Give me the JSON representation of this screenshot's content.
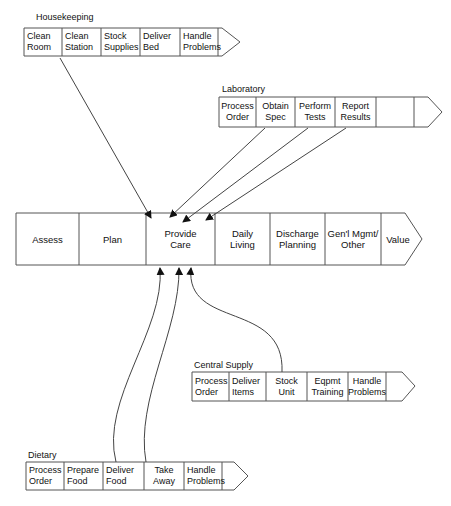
{
  "diagram": {
    "main_chain": {
      "cells": [
        {
          "label": "Assess"
        },
        {
          "label": "Plan"
        },
        {
          "label": "Provide\nCare"
        },
        {
          "label": "Daily\nLiving"
        },
        {
          "label": "Discharge\nPlanning"
        },
        {
          "label": "Gen'l Mgmt/\nOther"
        },
        {
          "label": "Value"
        }
      ]
    },
    "housekeeping": {
      "title": "Housekeeping",
      "cells": [
        {
          "label": "Clean\nRoom"
        },
        {
          "label": "Clean\nStation"
        },
        {
          "label": "Stock\nSupplies"
        },
        {
          "label": "Deliver\nBed"
        },
        {
          "label": "Handle\nProblems"
        }
      ]
    },
    "laboratory": {
      "title": "Laboratory",
      "cells": [
        {
          "label": "Process\nOrder"
        },
        {
          "label": "Obtain\nSpec"
        },
        {
          "label": "Perform\nTests"
        },
        {
          "label": "Report\nResults"
        },
        {
          "label": ""
        }
      ]
    },
    "central_supply": {
      "title": "Central Supply",
      "cells": [
        {
          "label": "Process\nOrder"
        },
        {
          "label": "Deliver\nItems"
        },
        {
          "label": "Stock\nUnit"
        },
        {
          "label": "Eqpmt\nTraining"
        },
        {
          "label": "Handle\nProblems"
        }
      ]
    },
    "dietary": {
      "title": "Dietary",
      "cells": [
        {
          "label": "Process\nOrder"
        },
        {
          "label": "Prepare\nFood"
        },
        {
          "label": "Deliver\nFood"
        },
        {
          "label": "Take\nAway"
        },
        {
          "label": "Handle\nProblems"
        }
      ]
    },
    "colors": {
      "line": "#555555",
      "text": "#111111",
      "background": "#ffffff"
    }
  }
}
